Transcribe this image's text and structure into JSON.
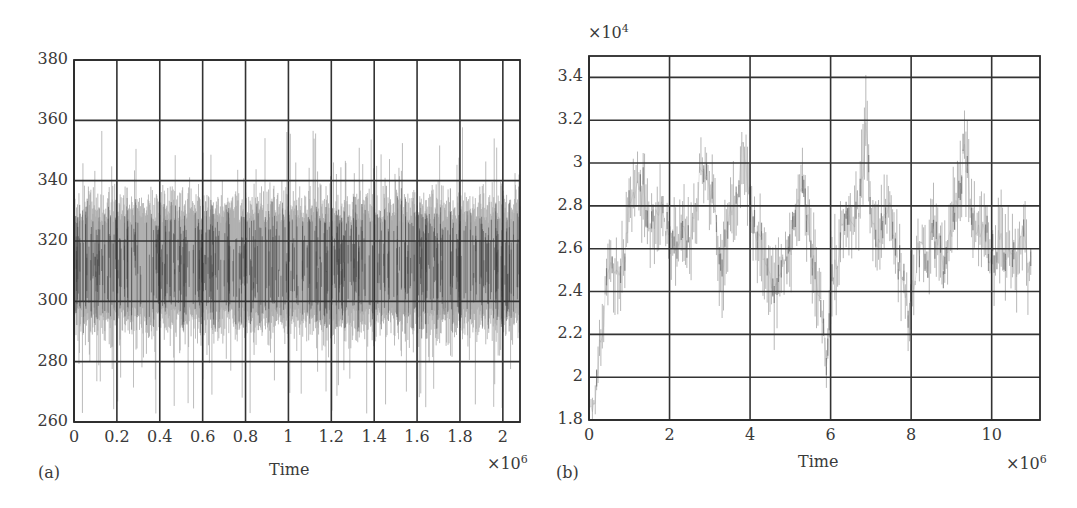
{
  "chart_data": [
    {
      "panel": "(a)",
      "type": "line",
      "title": "",
      "xlabel": "Time",
      "ylabel": "",
      "x_multiplier": "×10^6",
      "x_multiplier_base": "×10",
      "x_multiplier_exp": "6",
      "xlim": [
        0,
        2.08
      ],
      "ylim": [
        260,
        380
      ],
      "xticks": [
        0,
        0.2,
        0.4,
        0.6,
        0.8,
        1,
        1.2,
        1.4,
        1.6,
        1.8,
        2
      ],
      "xtick_labels": [
        "0",
        "0.2",
        "0.4",
        "0.6",
        "0.8",
        "1",
        "1.2",
        "1.4",
        "1.6",
        "1.8",
        "2"
      ],
      "yticks": [
        260,
        280,
        300,
        320,
        340,
        360,
        380
      ],
      "ytick_labels": [
        "260",
        "280",
        "300",
        "320",
        "340",
        "360",
        "380"
      ],
      "grid": true,
      "legend": null,
      "series": [
        {
          "name": "trace",
          "color": "#a8a8a8",
          "dark_color": "#3c3c3c",
          "description": "dense stationary noise around mean ~312; bulk band 285-340; spikes from ~262 to ~358",
          "mean": 312,
          "band": [
            285,
            340
          ],
          "extremes": [
            262,
            358
          ],
          "n_samples": 900
        }
      ]
    },
    {
      "panel": "(b)",
      "type": "line",
      "title": "",
      "xlabel": "Time",
      "ylabel": "",
      "x_multiplier": "×10^6",
      "x_multiplier_base": "×10",
      "x_multiplier_exp": "6",
      "y_multiplier": "×10^4",
      "y_multiplier_base": "×10",
      "y_multiplier_exp": "4",
      "xlim": [
        0,
        11.2
      ],
      "ylim": [
        1.8,
        3.5
      ],
      "xticks": [
        0,
        2,
        4,
        6,
        8,
        10
      ],
      "xtick_labels": [
        "0",
        "2",
        "4",
        "6",
        "8",
        "10"
      ],
      "yticks": [
        1.8,
        2,
        2.2,
        2.4,
        2.6,
        2.8,
        3,
        3.2,
        3.4
      ],
      "ytick_labels": [
        "1.8",
        "2",
        "2.2",
        "2.4",
        "2.6",
        "2.8",
        "3",
        "3.2",
        "3.4"
      ],
      "grid": true,
      "legend": null,
      "series": [
        {
          "name": "trace",
          "color": "#a0a0a0",
          "x": [
            0.1,
            0.3,
            0.5,
            0.7,
            0.9,
            1.0,
            1.2,
            1.4,
            1.5,
            1.7,
            1.8,
            2.0,
            2.2,
            2.3,
            2.5,
            2.6,
            2.8,
            3.0,
            3.1,
            3.3,
            3.5,
            3.7,
            3.8,
            3.9,
            4.0,
            4.2,
            4.3,
            4.5,
            4.6,
            4.8,
            5.0,
            5.2,
            5.3,
            5.5,
            5.6,
            5.8,
            5.9,
            6.0,
            6.2,
            6.3,
            6.5,
            6.6,
            6.8,
            6.9,
            7.0,
            7.2,
            7.3,
            7.5,
            7.6,
            7.8,
            7.9,
            8.1,
            8.2,
            8.4,
            8.5,
            8.7,
            8.8,
            9.0,
            9.2,
            9.3,
            9.5,
            9.7,
            9.8,
            10.0,
            10.2,
            10.3,
            10.5,
            10.6,
            10.8,
            10.9
          ],
          "y": [
            1.85,
            2.15,
            2.5,
            2.5,
            2.6,
            2.8,
            2.9,
            2.8,
            2.7,
            2.75,
            2.8,
            2.65,
            2.6,
            2.7,
            2.65,
            2.75,
            2.95,
            2.9,
            2.75,
            2.5,
            2.75,
            2.85,
            3.1,
            3.0,
            2.8,
            2.65,
            2.6,
            2.5,
            2.4,
            2.5,
            2.6,
            2.85,
            2.9,
            2.65,
            2.5,
            2.3,
            2.05,
            2.4,
            2.6,
            2.7,
            2.75,
            2.7,
            3.0,
            3.15,
            2.7,
            2.65,
            2.75,
            2.8,
            2.6,
            2.45,
            2.3,
            2.5,
            2.6,
            2.55,
            2.7,
            2.6,
            2.5,
            2.7,
            2.9,
            3.05,
            2.8,
            2.7,
            2.7,
            2.55,
            2.6,
            2.55,
            2.6,
            2.55,
            2.7,
            2.5
          ],
          "spread": [
            0.08,
            0.15,
            0.2,
            0.2,
            0.2,
            0.22,
            0.22,
            0.2,
            0.2,
            0.2,
            0.2,
            0.22,
            0.2,
            0.2,
            0.22,
            0.2,
            0.15,
            0.2,
            0.2,
            0.25,
            0.2,
            0.22,
            0.22,
            0.2,
            0.2,
            0.2,
            0.22,
            0.22,
            0.25,
            0.2,
            0.2,
            0.2,
            0.2,
            0.2,
            0.22,
            0.22,
            0.12,
            0.25,
            0.22,
            0.2,
            0.2,
            0.22,
            0.25,
            0.25,
            0.22,
            0.22,
            0.2,
            0.2,
            0.22,
            0.2,
            0.2,
            0.22,
            0.2,
            0.2,
            0.2,
            0.22,
            0.2,
            0.2,
            0.25,
            0.25,
            0.22,
            0.2,
            0.2,
            0.2,
            0.22,
            0.22,
            0.2,
            0.2,
            0.2,
            0.2
          ]
        }
      ]
    }
  ],
  "panels": {
    "a": {
      "tag": "(a)",
      "xlabel": "Time",
      "x_mult_base": "×10",
      "x_mult_exp": "6"
    },
    "b": {
      "tag": "(b)",
      "xlabel": "Time",
      "x_mult_base": "×10",
      "x_mult_exp": "6",
      "y_mult_base": "×10",
      "y_mult_exp": "4"
    }
  },
  "colors": {
    "axis": "#2a2a2a",
    "grid": "#333333",
    "trace_light": "#a8a8a8",
    "trace_dark": "#3c3c3c",
    "text": "#3a3a3a"
  }
}
